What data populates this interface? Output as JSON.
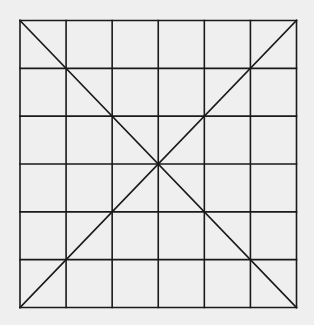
{
  "diagram": {
    "type": "grid-with-diagonals",
    "background": "#efefef",
    "line_color": "#1a1a1a",
    "line_width": 1.6,
    "grid": {
      "rows": 6,
      "cols": 6,
      "left": 20,
      "top": 20.5,
      "right": 296.5,
      "bottom": 307.5
    },
    "diagonals": [
      {
        "name": "top-left-to-bottom-right",
        "from": "top-left",
        "to": "bottom-right"
      },
      {
        "name": "top-right-to-bottom-left",
        "from": "top-right",
        "to": "bottom-left"
      }
    ]
  }
}
